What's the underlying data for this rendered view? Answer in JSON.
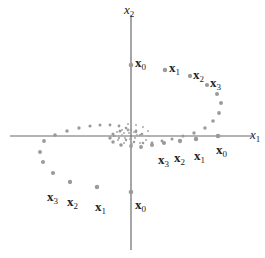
{
  "figure": {
    "width": 265,
    "height": 258,
    "colors": {
      "axis": "#6a6a6a",
      "point": "#9a9a9a",
      "text": "#222222"
    },
    "axes": {
      "origin": [
        131,
        136
      ],
      "x_axis": {
        "from": [
          10,
          136
        ],
        "to": [
          252,
          136
        ],
        "label": "x",
        "label_sub": "1",
        "label_pos": [
          250,
          128
        ]
      },
      "y_axis": {
        "from": [
          131,
          15
        ],
        "to": [
          131,
          250
        ],
        "label": "x",
        "label_sub": "2",
        "label_pos": [
          124,
          3
        ]
      }
    },
    "trajectories": [
      {
        "name": "trajectory-upper-start",
        "points": [
          [
            131,
            65
          ],
          [
            165,
            70
          ],
          [
            190,
            76
          ],
          [
            207,
            85
          ],
          [
            217,
            94
          ],
          [
            221,
            103
          ],
          [
            219,
            113
          ],
          [
            213,
            121
          ],
          [
            205,
            128
          ],
          [
            194,
            133
          ],
          [
            183,
            136
          ],
          [
            172,
            139
          ],
          [
            162,
            141
          ],
          [
            152,
            143
          ],
          [
            143,
            143
          ],
          [
            134,
            142
          ],
          [
            126,
            140
          ],
          [
            119,
            138
          ],
          [
            114,
            136
          ]
        ],
        "labels": [
          {
            "text": "x",
            "sub": "0",
            "pos": [
              135,
              54
            ]
          },
          {
            "text": "x",
            "sub": "1",
            "pos": [
              169,
              59
            ]
          },
          {
            "text": "x",
            "sub": "2",
            "pos": [
              193,
              66
            ]
          },
          {
            "text": "x",
            "sub": "3",
            "pos": [
              210,
              74
            ]
          }
        ]
      },
      {
        "name": "trajectory-right-start",
        "points": [
          [
            218,
            136
          ],
          [
            196,
            139
          ],
          [
            180,
            141
          ],
          [
            164,
            143
          ],
          [
            152,
            145
          ],
          [
            141,
            147
          ],
          [
            131,
            146
          ],
          [
            121,
            145
          ],
          [
            113,
            142
          ],
          [
            110,
            138
          ],
          [
            113,
            134
          ],
          [
            120,
            131
          ],
          [
            128,
            130
          ],
          [
            136,
            131
          ],
          [
            142,
            134
          ]
        ],
        "labels": [
          {
            "text": "x",
            "sub": "0",
            "pos": [
              216,
              141
            ]
          },
          {
            "text": "x",
            "sub": "1",
            "pos": [
              194,
              147
            ]
          },
          {
            "text": "x",
            "sub": "2",
            "pos": [
              174,
              149
            ]
          },
          {
            "text": "x",
            "sub": "3",
            "pos": [
              158,
              151
            ]
          }
        ]
      },
      {
        "name": "trajectory-lower-start",
        "points": [
          [
            131,
            192
          ],
          [
            97,
            187
          ],
          [
            70,
            182
          ],
          [
            53,
            173
          ],
          [
            43,
            162
          ],
          [
            40,
            152
          ],
          [
            44,
            141
          ],
          [
            55,
            135
          ],
          [
            67,
            131
          ],
          [
            79,
            128
          ],
          [
            90,
            126
          ],
          [
            100,
            125
          ],
          [
            110,
            125
          ],
          [
            119,
            126
          ],
          [
            126,
            128
          ],
          [
            131,
            130
          ],
          [
            136,
            132
          ],
          [
            140,
            135
          ]
        ],
        "labels": [
          {
            "text": "x",
            "sub": "0",
            "pos": [
              135,
              196
            ]
          },
          {
            "text": "x",
            "sub": "1",
            "pos": [
              95,
              198
            ]
          },
          {
            "text": "x",
            "sub": "2",
            "pos": [
              67,
              193
            ]
          },
          {
            "text": "x",
            "sub": "3",
            "pos": [
              47,
              188
            ]
          }
        ]
      },
      {
        "name": "trajectory-inner-spiral",
        "points": [
          [
            128,
            124
          ],
          [
            136,
            125
          ],
          [
            143,
            127
          ],
          [
            148,
            131
          ],
          [
            149,
            136
          ],
          [
            146,
            140
          ],
          [
            140,
            143
          ],
          [
            132,
            144
          ],
          [
            124,
            143
          ],
          [
            118,
            140
          ],
          [
            115,
            136
          ],
          [
            117,
            132
          ],
          [
            122,
            130
          ],
          [
            128,
            130
          ],
          [
            134,
            132
          ],
          [
            137,
            135
          ],
          [
            135,
            138
          ],
          [
            130,
            139
          ],
          [
            125,
            138
          ],
          [
            122,
            135
          ],
          [
            124,
            133
          ],
          [
            129,
            133
          ]
        ]
      }
    ]
  }
}
